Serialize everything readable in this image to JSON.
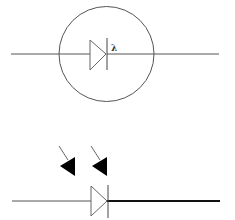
{
  "diagram": {
    "type": "electronic-schematic-symbols",
    "symbols": [
      {
        "name": "photodiode-enclosed",
        "description": "Diode symbol inside a circle with wavelength label",
        "label": "λ",
        "colors": {
          "stroke": "#555555",
          "background": "#ffffff"
        }
      },
      {
        "name": "photodiode-with-light-arrows",
        "description": "Diode symbol with two incoming light arrows; output lead drawn thick",
        "arrow_count": 2,
        "colors": {
          "stroke": "#555555",
          "thick_lead": "#111111",
          "arrow": "#000000"
        }
      }
    ]
  }
}
